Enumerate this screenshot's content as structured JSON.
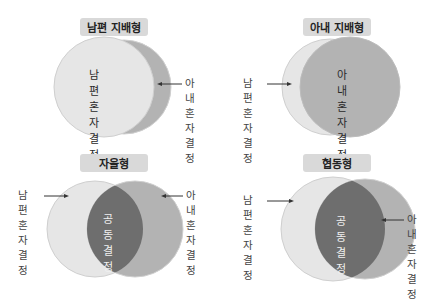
{
  "colors": {
    "husband_circle": "#e6e6e6",
    "wife_circle": "#b3b3b3",
    "overlap": "#6e6e6e",
    "title_bg": "#d9d9d9",
    "outline": "#cfcfcf"
  },
  "panels": [
    {
      "title": "남편 지배형",
      "inner_label": [
        "남편",
        "혼자",
        "결정"
      ],
      "right_label": [
        "아내",
        "혼자",
        "결정"
      ]
    },
    {
      "title": "아내 지배형",
      "inner_label": [
        "아내",
        "혼자",
        "결정"
      ],
      "left_label": [
        "남편",
        "혼자",
        "결정"
      ]
    },
    {
      "title": "자율형",
      "inner_label": [
        "공동",
        "결정"
      ],
      "left_label": [
        "남편",
        "혼자",
        "결정"
      ],
      "right_label": [
        "아내",
        "혼자",
        "결정"
      ]
    },
    {
      "title": "협동형",
      "inner_label": [
        "공동",
        "결정"
      ],
      "left_label": [
        "남편",
        "혼자",
        "결정"
      ],
      "right_label": [
        "아내",
        "혼자",
        "결정"
      ]
    }
  ]
}
